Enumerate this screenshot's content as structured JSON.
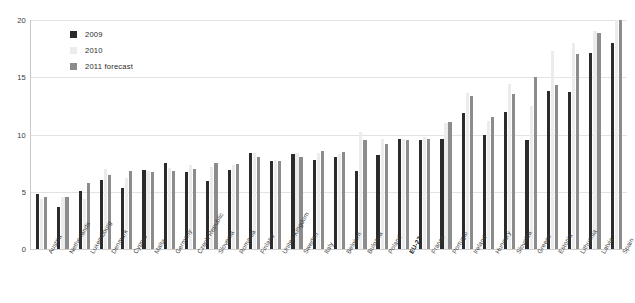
{
  "chart_data": {
    "type": "bar",
    "title": "",
    "subtitle": "",
    "xlabel": "",
    "ylabel": "",
    "ylim": [
      0,
      20
    ],
    "yticks": [
      0,
      5,
      10,
      15,
      20
    ],
    "grid": true,
    "legend_position": "top-left",
    "categories": [
      "Austria",
      "Netherlands",
      "Luxembourg",
      "Denmark",
      "Cyprus",
      "Malta",
      "Germany",
      "Czech Republic",
      "Slovenia",
      "Romania",
      "Finland",
      "United Kingdom",
      "Sweden",
      "Italy",
      "Belgium",
      "Bulgaria",
      "Poland",
      "EU-27",
      "France",
      "Portugal",
      "Ireland",
      "Hungary",
      "Slovakia",
      "Greece",
      "Estonia",
      "Lithuania",
      "Latvia",
      "Spain"
    ],
    "highlight_category": "EU-27",
    "series": [
      {
        "name": "2009",
        "color": "#2b2b2b",
        "values": [
          4.8,
          3.7,
          5.1,
          6.0,
          5.3,
          6.9,
          7.5,
          6.7,
          5.9,
          6.9,
          8.4,
          7.7,
          8.3,
          7.8,
          8.0,
          6.8,
          8.2,
          9.6,
          9.5,
          9.6,
          11.9,
          10.0,
          12.0,
          9.5,
          13.8,
          13.7,
          17.1,
          18.0
        ]
      },
      {
        "name": "2010",
        "color": "#ececec",
        "values": [
          4.4,
          4.5,
          4.4,
          7.0,
          6.2,
          6.8,
          7.1,
          7.3,
          7.2,
          7.3,
          8.4,
          7.8,
          8.4,
          8.4,
          8.3,
          10.2,
          9.6,
          9.6,
          9.8,
          11.0,
          13.6,
          11.2,
          14.4,
          12.5,
          17.3,
          18.0,
          19.0,
          20.1
        ]
      },
      {
        "name": "2011 forecast",
        "color": "#8c8c8c",
        "values": [
          4.5,
          4.5,
          5.8,
          6.5,
          6.8,
          6.7,
          6.8,
          7.0,
          7.5,
          7.4,
          8.0,
          7.7,
          8.0,
          8.6,
          8.5,
          9.5,
          9.2,
          9.5,
          9.6,
          11.1,
          13.4,
          11.5,
          13.5,
          15.0,
          14.3,
          17.0,
          18.9,
          20.6
        ]
      }
    ]
  }
}
